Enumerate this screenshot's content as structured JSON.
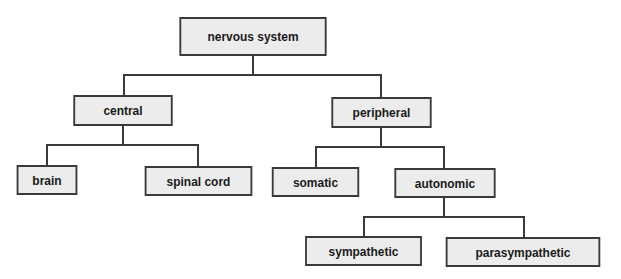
{
  "diagram": {
    "title": "nervous system",
    "nodes": {
      "root": "nervous system",
      "central": "central",
      "peripheral": "peripheral",
      "brain": "brain",
      "spinal_cord": "spinal cord",
      "somatic": "somatic",
      "autonomic": "autonomic",
      "sympathetic": "sympathetic",
      "parasympathetic": "parasympathetic"
    },
    "edges": [
      [
        "nervous system",
        "central"
      ],
      [
        "nervous system",
        "peripheral"
      ],
      [
        "central",
        "brain"
      ],
      [
        "central",
        "spinal cord"
      ],
      [
        "peripheral",
        "somatic"
      ],
      [
        "peripheral",
        "autonomic"
      ],
      [
        "autonomic",
        "sympathetic"
      ],
      [
        "autonomic",
        "parasympathetic"
      ]
    ]
  }
}
